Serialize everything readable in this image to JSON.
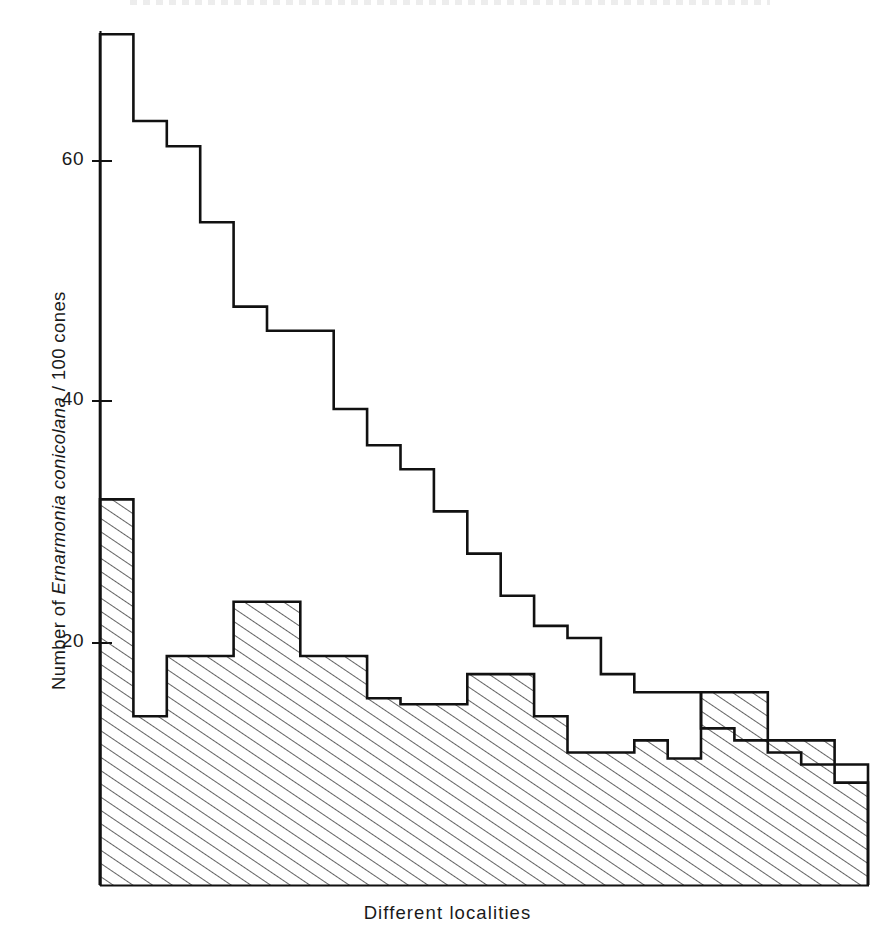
{
  "figure": {
    "ylabel_prefix": "Number of ",
    "ylabel_species": "Ernarmonia conicolana",
    "ylabel_suffix": " / 100 cones",
    "ylabel_full": "Number of Ernarmonia conicolana / 100 cones",
    "xlabel": "Different localities",
    "line_color": "#111111",
    "hatch_color": "#2a2a2a",
    "background_color": "#ffffff"
  },
  "chart_data": {
    "type": "area",
    "title": "",
    "subtitle": "",
    "xlabel": "Different localities",
    "ylabel": "Number of Ernarmonia conicolana / 100 cones",
    "ylim": [
      0,
      74
    ],
    "xlim": [
      0,
      23
    ],
    "yticks": [
      20,
      40,
      60
    ],
    "ytick_labels": [
      "20",
      "40",
      "60"
    ],
    "xticks": [],
    "xtick_labels": [],
    "grid": false,
    "legend": null,
    "legend_position": "none",
    "x_categories": [
      "1",
      "2",
      "3",
      "4",
      "5",
      "6",
      "7",
      "8",
      "9",
      "10",
      "11",
      "12",
      "13",
      "14",
      "15",
      "16",
      "17",
      "18",
      "19",
      "20",
      "21",
      "22",
      "23"
    ],
    "series": [
      {
        "name": "Total cones attacked (outline, unshaded)",
        "style": "step-outline",
        "fill": "none",
        "values": [
          70.6,
          63.4,
          61.3,
          55.0,
          48.0,
          46.0,
          46.0,
          39.5,
          36.5,
          34.5,
          31.0,
          27.5,
          24.0,
          21.5,
          20.5,
          17.5,
          16.0,
          16.0,
          13.0,
          12.0,
          11.0,
          10.0,
          10.0
        ]
      },
      {
        "name": "Cones attacked (hatched)",
        "style": "step-hatched",
        "fill": "diagonal-hatch",
        "values": [
          32.0,
          14.0,
          19.0,
          19.0,
          23.5,
          23.5,
          19.0,
          19.0,
          15.5,
          15.0,
          15.0,
          17.5,
          17.5,
          14.0,
          11.0,
          11.0,
          12.0,
          10.5,
          16.0,
          16.0,
          12.0,
          12.0,
          8.5
        ]
      }
    ],
    "annotations": []
  },
  "axis_geometry": {
    "plot_left_px": 100,
    "plot_right_px": 868,
    "baseline_y_px": 885,
    "y60_px": 161,
    "y40_px": 401,
    "y20_px": 643,
    "px_per_unit": 12.05
  }
}
